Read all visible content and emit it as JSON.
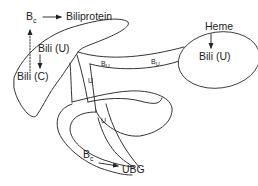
{
  "diagram": {
    "colors": {
      "line": "#333333",
      "text": "#222222",
      "background": "#ffffff"
    },
    "labels": {
      "bc_top": {
        "main": "B",
        "sub": "c"
      },
      "biliprotein": "Biliprotein",
      "bili_u_liver": "Bili (U)",
      "bili_c": "Bili (C)",
      "heme": "Heme",
      "bili_u_heme": "Bili (U)",
      "bu_left": {
        "main": "B",
        "sub": "U"
      },
      "bu_right": {
        "main": "B",
        "sub": "U"
      },
      "u_duct_upper": "U",
      "u_duct_lower": "U",
      "bc_bottom": {
        "main": "B",
        "sub": "c"
      },
      "ubg": "UBG"
    },
    "arrows": [
      {
        "from": "B_c",
        "to": "Biliprotein",
        "style": "solid"
      },
      {
        "from": "Bili (C)",
        "to": "B_c",
        "style": "dotted"
      },
      {
        "from": "Bili (U)",
        "to": "Bili (C)",
        "style": "solid"
      },
      {
        "from": "Heme",
        "to": "Bili (U)",
        "style": "solid"
      },
      {
        "from": "B_c",
        "to": "UBG",
        "style": "solid"
      }
    ]
  }
}
